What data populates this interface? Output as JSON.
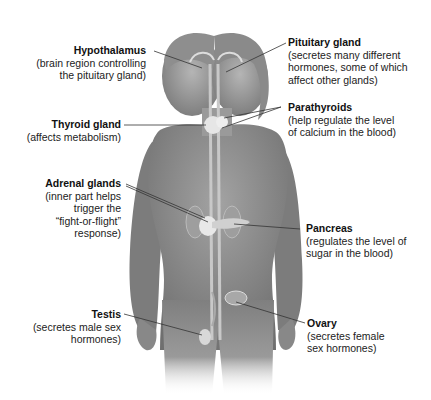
{
  "diagram": {
    "type": "human endocrine system",
    "colors": {
      "background": "#ffffff",
      "skin": "#8c8c8c",
      "skin_dark": "#6e6e6e",
      "gland": "#e6e6e6",
      "leader_line": "#333333",
      "text": "#222222"
    },
    "labels": [
      {
        "id": "hypothalamus",
        "title": "Hypothalamus",
        "desc": [
          "(brain region controlling",
          "the pituitary gland)"
        ],
        "side": "left"
      },
      {
        "id": "thyroid",
        "title": "Thyroid gland",
        "desc": [
          "(affects metabolism)"
        ],
        "side": "left"
      },
      {
        "id": "adrenal",
        "title": "Adrenal glands",
        "desc": [
          "(inner part helps",
          "trigger the",
          "“fight-or-flight”",
          "response)"
        ],
        "side": "left"
      },
      {
        "id": "testis",
        "title": "Testis",
        "desc": [
          "(secretes male sex",
          "hormones)"
        ],
        "side": "left"
      },
      {
        "id": "pituitary",
        "title": "Pituitary gland",
        "desc": [
          "(secretes many different",
          "hormones, some of which",
          "affect other glands)"
        ],
        "side": "right"
      },
      {
        "id": "parathyroids",
        "title": "Parathyroids",
        "desc": [
          "(help regulate the level",
          "of calcium in the blood)"
        ],
        "side": "right"
      },
      {
        "id": "pancreas",
        "title": "Pancreas",
        "desc": [
          "(regulates the level of",
          "sugar in the blood)"
        ],
        "side": "right"
      },
      {
        "id": "ovary",
        "title": "Ovary",
        "desc": [
          "(secretes female",
          "sex hormones)"
        ],
        "side": "right"
      }
    ]
  }
}
